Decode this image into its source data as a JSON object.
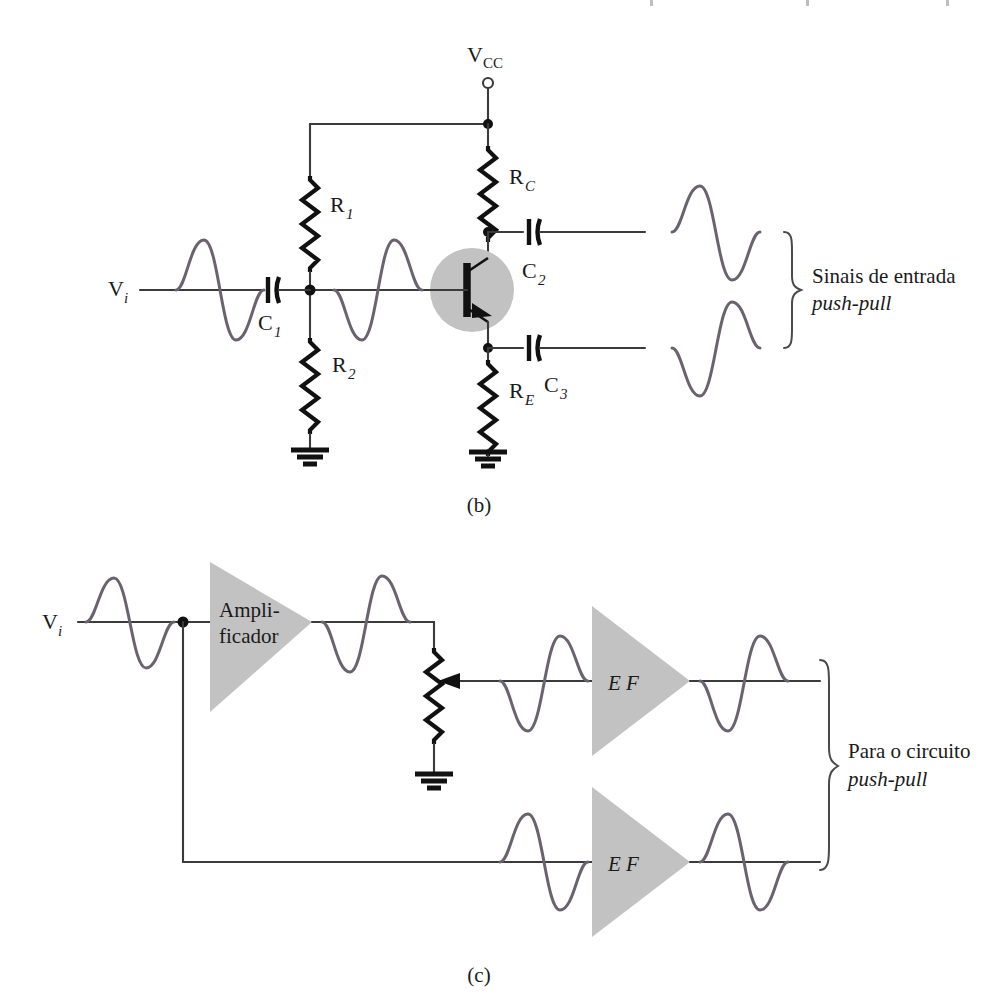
{
  "figure": {
    "panels": [
      {
        "id": "b",
        "caption": "(b)",
        "description": "Amplificador de emissor comum com saidas push-pull"
      },
      {
        "id": "c",
        "caption": "(c)",
        "description": "Amplificador seguido de dois seguidores de emissor"
      }
    ]
  },
  "panel_b": {
    "caption": "(b)",
    "supply": {
      "label_main": "V",
      "label_sub": "CC",
      "terminal": "open-circle-terminal"
    },
    "input": {
      "label_main": "V",
      "label_sub": "i"
    },
    "components": [
      {
        "name": "R1",
        "label_main": "R",
        "label_sub": "1",
        "type": "resistor"
      },
      {
        "name": "R2",
        "label_main": "R",
        "label_sub": "2",
        "type": "resistor"
      },
      {
        "name": "RC",
        "label_main": "R",
        "label_sub": "C",
        "type": "resistor"
      },
      {
        "name": "RE",
        "label_main": "R",
        "label_sub": "E",
        "type": "resistor"
      },
      {
        "name": "C1",
        "label_main": "C",
        "label_sub": "1",
        "type": "capacitor"
      },
      {
        "name": "C2",
        "label_main": "C",
        "label_sub": "2",
        "type": "capacitor"
      },
      {
        "name": "C3",
        "label_main": "C",
        "label_sub": "3",
        "type": "capacitor"
      },
      {
        "name": "Q1",
        "label_main": "",
        "label_sub": "",
        "type": "npn-transistor"
      }
    ],
    "annotation": {
      "line1": "Sinais de entrada",
      "line2": "push-pull"
    },
    "waveforms": [
      {
        "name": "input-wave",
        "phase": "positive-first"
      },
      {
        "name": "base-wave",
        "phase": "negative-first"
      },
      {
        "name": "collector-wave",
        "phase": "positive-first"
      },
      {
        "name": "emitter-wave",
        "phase": "negative-first"
      }
    ]
  },
  "panel_c": {
    "caption": "(c)",
    "input": {
      "label_main": "V",
      "label_sub": "i"
    },
    "blocks": [
      {
        "name": "amplifier",
        "label_line1": "Ampli-",
        "label_line2": "ficador"
      },
      {
        "name": "emitter-follower-top",
        "label_line1": "E F",
        "label_line2": ""
      },
      {
        "name": "emitter-follower-bottom",
        "label_line1": "E F",
        "label_line2": ""
      }
    ],
    "components": [
      {
        "name": "potentiometer",
        "type": "potentiometer-with-wiper"
      },
      {
        "name": "ground",
        "type": "ground"
      }
    ],
    "annotation": {
      "line1": "Para o circuito",
      "line2": "push-pull"
    },
    "waveforms": [
      {
        "name": "input-wave",
        "phase": "positive-first"
      },
      {
        "name": "amplifier-output-wave",
        "phase": "negative-first"
      },
      {
        "name": "pot-tap-wave",
        "phase": "negative-first"
      },
      {
        "name": "ef-top-output-wave",
        "phase": "negative-first"
      },
      {
        "name": "ef-bottom-input-wave",
        "phase": "positive-first"
      },
      {
        "name": "ef-bottom-output-wave",
        "phase": "positive-first"
      }
    ]
  },
  "colors": {
    "wire": "#3b3b3b",
    "waveform": "#6b6270",
    "component": "#111111",
    "block_fill": "#c2c2c2",
    "background": "#ffffff"
  }
}
